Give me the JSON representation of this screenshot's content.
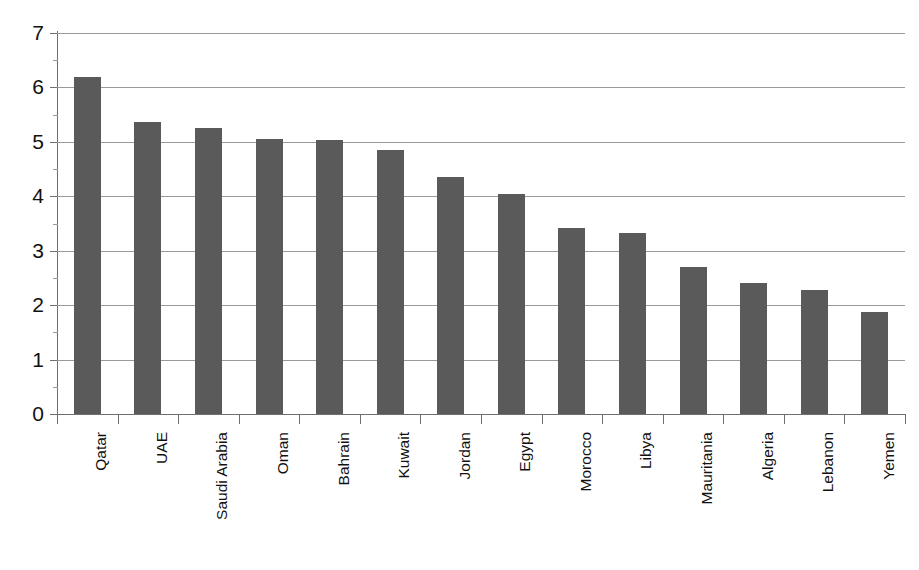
{
  "figure": {
    "title_remnant": "",
    "background_color": "#ffffff",
    "bar_color": "#5a5a5a",
    "gridline_color": "#9a9a9a",
    "axis_color": "#6f6f6f"
  },
  "chart_data": {
    "type": "bar",
    "title": "",
    "xlabel": "",
    "ylabel": "",
    "ylim": [
      0,
      7
    ],
    "yticks": [
      0,
      1,
      2,
      3,
      4,
      5,
      6,
      7
    ],
    "grid": true,
    "legend": "none",
    "orientation": "vertical",
    "categories": [
      "Qatar",
      "UAE",
      "Saudi Arabia",
      "Oman",
      "Bahrain",
      "Kuwait",
      "Jordan",
      "Egypt",
      "Morocco",
      "Libya",
      "Mauritania",
      "Algeria",
      "Lebanon",
      "Yemen"
    ],
    "values": [
      6.2,
      5.37,
      5.25,
      5.05,
      5.03,
      4.85,
      4.35,
      4.05,
      3.42,
      3.33,
      2.7,
      2.4,
      2.28,
      1.88
    ]
  }
}
